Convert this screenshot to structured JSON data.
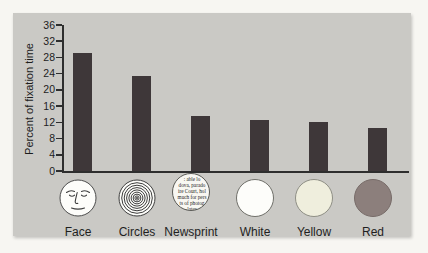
{
  "figure": {
    "kind": "textbook bar chart of infant visual preference",
    "y_axis_title": "Percent of fixation time"
  },
  "chart_data": {
    "type": "bar",
    "categories": [
      "Face",
      "Circles",
      "Newsprint",
      "White",
      "Yellow",
      "Red"
    ],
    "values": [
      29,
      23.5,
      13.5,
      12.5,
      12,
      10.5
    ],
    "title": "",
    "xlabel": "",
    "ylabel": "Percent of fixation time",
    "ylim": [
      0,
      36
    ],
    "ytick_step": 4,
    "ytick_labels": [
      "0",
      "4",
      "8",
      "12",
      "16",
      "20",
      "24",
      "28",
      "32",
      "36"
    ],
    "grid": false,
    "legend": false,
    "bar_color": "#3e3739"
  },
  "stimuli": [
    {
      "label": "Face",
      "icon": "face-icon",
      "fill": "#fdfdfa"
    },
    {
      "label": "Circles",
      "icon": "concentric-circles-icon",
      "fill": "#fdfdfa"
    },
    {
      "label": "Newsprint",
      "icon": "newsprint-icon",
      "fill": "#f8f7f2"
    },
    {
      "label": "White",
      "icon": "white-disc-icon",
      "fill": "#fdfdfa"
    },
    {
      "label": "Yellow",
      "icon": "yellow-disc-icon",
      "fill": "#efeedd"
    },
    {
      "label": "Red",
      "icon": "red-disc-icon",
      "fill": "#8c7f7c"
    }
  ],
  "newsprint_text": {
    "lines": [
      ": able lo",
      "dova, parado",
      "ire Court, hol",
      "much for pers",
      "ts of photog",
      "-lates-"
    ]
  },
  "colors": {
    "panel_background": "#cac9c5",
    "page_background": "#f7f6f2",
    "axis": "#2e2e2e",
    "bar": "#3e3739"
  }
}
